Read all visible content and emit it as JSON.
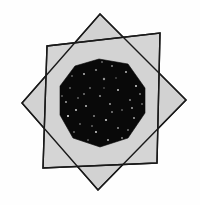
{
  "figure": {
    "title": "Eight-pointed star figure",
    "background_color": "#fefefe",
    "star_fill_color": "#d2d2d2",
    "star_stroke_color": "#1a1a1a",
    "core_fill_color": "#090909",
    "speckle_color": "#f2f2f2",
    "stroke_width": 1.4,
    "canvas": {
      "width": 200,
      "height": 205
    },
    "star": {
      "point_count": 8,
      "outer_points": [
        {
          "name": "top",
          "x": 100,
          "y": 14
        },
        {
          "name": "upper-right",
          "x": 160,
          "y": 33
        },
        {
          "name": "right",
          "x": 186,
          "y": 100
        },
        {
          "name": "lower-right",
          "x": 157,
          "y": 163
        },
        {
          "name": "bottom",
          "x": 98,
          "y": 190
        },
        {
          "name": "lower-left",
          "x": 43,
          "y": 168
        },
        {
          "name": "left",
          "x": 22,
          "y": 103
        },
        {
          "name": "upper-left",
          "x": 47,
          "y": 46
        }
      ],
      "inner_points": [
        {
          "name": "inner-ne-upper",
          "x": 122,
          "y": 62
        },
        {
          "name": "inner-ne",
          "x": 139,
          "y": 78
        },
        {
          "name": "inner-e",
          "x": 143,
          "y": 104
        },
        {
          "name": "inner-se",
          "x": 132,
          "y": 130
        },
        {
          "name": "inner-s",
          "x": 114,
          "y": 144
        },
        {
          "name": "inner-sw",
          "x": 87,
          "y": 146
        },
        {
          "name": "inner-w-lower",
          "x": 67,
          "y": 134
        },
        {
          "name": "inner-w",
          "x": 58,
          "y": 110
        },
        {
          "name": "inner-nw",
          "x": 61,
          "y": 84
        },
        {
          "name": "inner-n",
          "x": 78,
          "y": 65
        },
        {
          "name": "inner-n-right",
          "x": 99,
          "y": 58
        }
      ],
      "quad_a": [
        {
          "x": 100,
          "y": 14
        },
        {
          "x": 186,
          "y": 100
        },
        {
          "x": 98,
          "y": 190
        },
        {
          "x": 22,
          "y": 103
        }
      ],
      "quad_b": [
        {
          "x": 160,
          "y": 33
        },
        {
          "x": 157,
          "y": 163
        },
        {
          "x": 43,
          "y": 168
        },
        {
          "x": 47,
          "y": 46
        }
      ],
      "core_polygon": [
        {
          "x": 99,
          "y": 59
        },
        {
          "x": 128,
          "y": 64
        },
        {
          "x": 145,
          "y": 88
        },
        {
          "x": 145,
          "y": 113
        },
        {
          "x": 128,
          "y": 138
        },
        {
          "x": 100,
          "y": 147
        },
        {
          "x": 73,
          "y": 138
        },
        {
          "x": 60,
          "y": 115
        },
        {
          "x": 60,
          "y": 86
        },
        {
          "x": 75,
          "y": 66
        }
      ],
      "speckles": [
        {
          "x": 96,
          "y": 70,
          "r": 1.1
        },
        {
          "x": 112,
          "y": 66,
          "r": 0.8
        },
        {
          "x": 84,
          "y": 74,
          "r": 0.9
        },
        {
          "x": 126,
          "y": 72,
          "r": 1.0
        },
        {
          "x": 70,
          "y": 88,
          "r": 0.8
        },
        {
          "x": 104,
          "y": 79,
          "r": 1.2
        },
        {
          "x": 136,
          "y": 86,
          "r": 0.9
        },
        {
          "x": 90,
          "y": 88,
          "r": 0.7
        },
        {
          "x": 118,
          "y": 90,
          "r": 1.0
        },
        {
          "x": 66,
          "y": 102,
          "r": 0.9
        },
        {
          "x": 78,
          "y": 98,
          "r": 0.8
        },
        {
          "x": 100,
          "y": 96,
          "r": 1.1
        },
        {
          "x": 130,
          "y": 100,
          "r": 0.8
        },
        {
          "x": 142,
          "y": 104,
          "r": 0.7
        },
        {
          "x": 86,
          "y": 106,
          "r": 1.0
        },
        {
          "x": 110,
          "y": 104,
          "r": 0.9
        },
        {
          "x": 122,
          "y": 110,
          "r": 0.8
        },
        {
          "x": 68,
          "y": 116,
          "r": 1.0
        },
        {
          "x": 94,
          "y": 116,
          "r": 0.8
        },
        {
          "x": 106,
          "y": 120,
          "r": 1.1
        },
        {
          "x": 134,
          "y": 118,
          "r": 0.9
        },
        {
          "x": 80,
          "y": 124,
          "r": 0.8
        },
        {
          "x": 118,
          "y": 128,
          "r": 1.0
        },
        {
          "x": 96,
          "y": 132,
          "r": 0.9
        },
        {
          "x": 74,
          "y": 132,
          "r": 0.7
        },
        {
          "x": 128,
          "y": 130,
          "r": 0.8
        },
        {
          "x": 108,
          "y": 140,
          "r": 1.0
        },
        {
          "x": 88,
          "y": 140,
          "r": 0.8
        },
        {
          "x": 116,
          "y": 78,
          "r": 0.7
        },
        {
          "x": 76,
          "y": 110,
          "r": 0.9
        },
        {
          "x": 140,
          "y": 94,
          "r": 0.8
        },
        {
          "x": 62,
          "y": 96,
          "r": 0.7
        },
        {
          "x": 102,
          "y": 62,
          "r": 0.8
        },
        {
          "x": 122,
          "y": 138,
          "r": 0.9
        },
        {
          "x": 84,
          "y": 94,
          "r": 0.7
        },
        {
          "x": 112,
          "y": 112,
          "r": 0.8
        },
        {
          "x": 92,
          "y": 126,
          "r": 0.7
        },
        {
          "x": 132,
          "y": 108,
          "r": 0.9
        },
        {
          "x": 72,
          "y": 76,
          "r": 0.8
        },
        {
          "x": 104,
          "y": 88,
          "r": 0.7
        }
      ]
    }
  }
}
